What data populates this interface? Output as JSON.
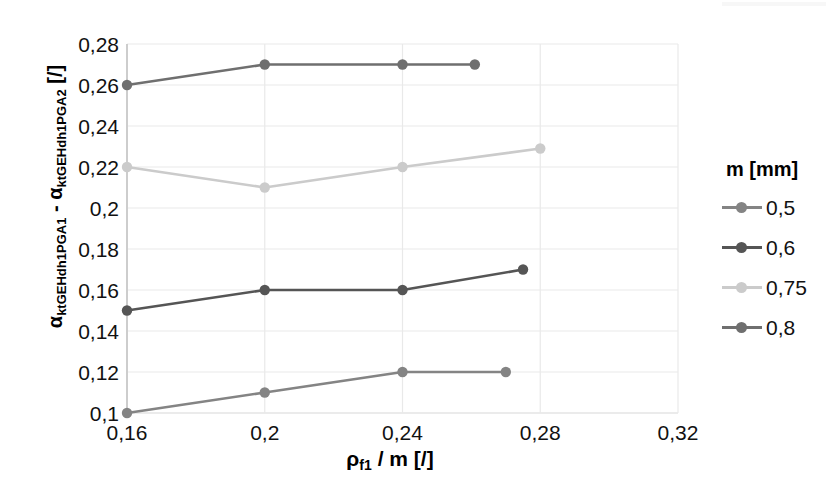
{
  "chart_data": {
    "type": "line",
    "title": "",
    "xlabel": "ρf1 / m [/]",
    "ylabel": "αktGEHdh1PGA1 - αktGEHdh1PGA2 [/]",
    "xlim": [
      0.16,
      0.32
    ],
    "ylim": [
      0.1,
      0.28
    ],
    "xticks": [
      "0,16",
      "0,2",
      "0,24",
      "0,28",
      "0,32"
    ],
    "xtick_values": [
      0.16,
      0.2,
      0.24,
      0.28,
      0.32
    ],
    "yticks": [
      "0,1",
      "0,12",
      "0,14",
      "0,16",
      "0,18",
      "0,2",
      "0,22",
      "0,24",
      "0,26",
      "0,28"
    ],
    "ytick_values": [
      0.1,
      0.12,
      0.14,
      0.16,
      0.18,
      0.2,
      0.22,
      0.24,
      0.26,
      0.28
    ],
    "grid": true,
    "legend_position": "right",
    "legend_title": "m [mm]",
    "series": [
      {
        "name": "0,5",
        "color": "#848484",
        "x": [
          0.16,
          0.2,
          0.24,
          0.27
        ],
        "values": [
          0.1,
          0.11,
          0.12,
          0.12
        ]
      },
      {
        "name": "0,6",
        "color": "#555555",
        "x": [
          0.16,
          0.2,
          0.24,
          0.275
        ],
        "values": [
          0.15,
          0.16,
          0.16,
          0.17
        ]
      },
      {
        "name": "0,75",
        "color": "#cbcbcb",
        "x": [
          0.16,
          0.2,
          0.24,
          0.28
        ],
        "values": [
          0.22,
          0.21,
          0.22,
          0.229
        ]
      },
      {
        "name": "0,8",
        "color": "#6f6f6f",
        "x": [
          0.16,
          0.2,
          0.24,
          0.261
        ],
        "values": [
          0.26,
          0.27,
          0.27,
          0.27
        ]
      }
    ]
  },
  "axis": {
    "x_title_main": "ρ",
    "x_title_sub": "f1",
    "x_title_rest": " / m [/]",
    "y_title_alpha1": "α",
    "y_title_sub1": "ktGEHdh1PGA1",
    "y_title_dash": " - ",
    "y_title_alpha2": "α",
    "y_title_sub2": "ktGEHdh1PGA2",
    "y_title_unit": " [/]"
  },
  "legend": {
    "title": "m [mm]",
    "items": [
      {
        "label": "0,5",
        "color": "#848484"
      },
      {
        "label": "0,6",
        "color": "#555555"
      },
      {
        "label": "0,75",
        "color": "#cbcbcb"
      },
      {
        "label": "0,8",
        "color": "#6f6f6f"
      }
    ]
  },
  "colors": {
    "grid": "#e9e9e9",
    "axis": "#c9c9c9",
    "text": "#111111",
    "background": "#ffffff"
  }
}
